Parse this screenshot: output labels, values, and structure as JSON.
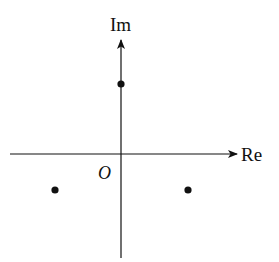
{
  "diagram": {
    "type": "complex-plane",
    "axes": {
      "horizontal": {
        "label": "Re",
        "x1": 10,
        "x2": 237,
        "y": 154
      },
      "vertical": {
        "label": "Im",
        "x": 121,
        "y1": 258,
        "y2": 40
      }
    },
    "origin": {
      "label": "O",
      "x": 121,
      "y": 154
    },
    "points": [
      {
        "name": "top-point",
        "x": 121,
        "y": 84,
        "r": 3.6
      },
      {
        "name": "lower-left-point",
        "x": 55,
        "y": 190,
        "r": 3.6
      },
      {
        "name": "lower-right-point",
        "x": 188,
        "y": 190,
        "r": 3.6
      }
    ],
    "colors": {
      "stroke": "#111111",
      "fill": "#111111",
      "background": "#ffffff"
    }
  }
}
